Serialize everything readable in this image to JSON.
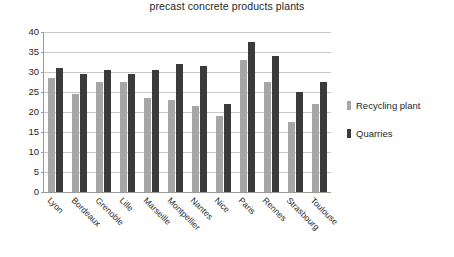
{
  "chart_data": {
    "type": "bar",
    "title": "Average transport distance (km) of aggregates supplied to ready-mixed concrete and precast concrete products plants",
    "title_lines": [
      "Average transport distance (km) of aggregates supplied to ready-mixed concrete and",
      "precast concrete products plants"
    ],
    "xlabel": "",
    "ylabel": "",
    "ylim": [
      0,
      40
    ],
    "yticks": [
      0,
      5,
      10,
      15,
      20,
      25,
      30,
      35,
      40
    ],
    "grid": true,
    "legend_position": "right",
    "categories": [
      "Lyon",
      "Bordeaux",
      "Grenoble",
      "Lille",
      "Marseille",
      "Montpellier",
      "Nantes",
      "Nice",
      "Paris",
      "Rennes",
      "Strasbourg",
      "Toulouse"
    ],
    "series": [
      {
        "name": "Recycling plant",
        "color": "#a6a6a6",
        "values": [
          28.5,
          24.5,
          27.5,
          27.5,
          23.5,
          23.0,
          21.5,
          19.0,
          33.0,
          27.5,
          17.5,
          22.0
        ]
      },
      {
        "name": "Quarries",
        "color": "#3b3b3b",
        "values": [
          31.0,
          29.5,
          30.5,
          29.5,
          30.5,
          32.0,
          31.5,
          22.0,
          37.5,
          34.0,
          25.0,
          27.5
        ]
      }
    ]
  },
  "legend": {
    "items": [
      {
        "label": "Recycling plant"
      },
      {
        "label": "Quarries"
      }
    ]
  }
}
